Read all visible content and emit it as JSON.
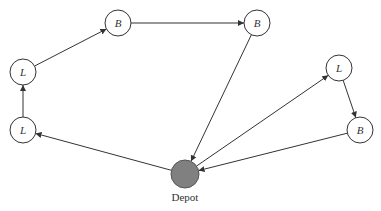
{
  "diagram": {
    "type": "vehicle-routing-graph",
    "nodes": [
      {
        "id": "L1",
        "label": "L",
        "cx": 23,
        "cy": 130
      },
      {
        "id": "L2",
        "label": "L",
        "cx": 23,
        "cy": 72
      },
      {
        "id": "B1",
        "label": "B",
        "cx": 118,
        "cy": 23
      },
      {
        "id": "B2",
        "label": "B",
        "cx": 257,
        "cy": 23
      },
      {
        "id": "L3",
        "label": "L",
        "cx": 339,
        "cy": 68
      },
      {
        "id": "B3",
        "label": "B",
        "cx": 360,
        "cy": 130
      }
    ],
    "depot": {
      "id": "D",
      "label": "Depot",
      "cx": 185,
      "cy": 174,
      "fill": "#808080"
    },
    "edges": [
      {
        "from": "D",
        "to": "L1"
      },
      {
        "from": "L1",
        "to": "L2"
      },
      {
        "from": "L2",
        "to": "B1"
      },
      {
        "from": "B1",
        "to": "B2"
      },
      {
        "from": "B2",
        "to": "D"
      },
      {
        "from": "D",
        "to": "L3"
      },
      {
        "from": "L3",
        "to": "B3"
      },
      {
        "from": "B3",
        "to": "D"
      }
    ],
    "colors": {
      "stroke": "#333333",
      "node_fill": "#ffffff",
      "depot_fill": "#808080"
    }
  }
}
